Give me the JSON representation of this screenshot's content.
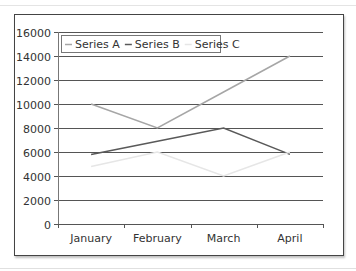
{
  "chart_data": {
    "type": "line",
    "title": "",
    "xlabel": "",
    "ylabel": "",
    "categories": [
      "January",
      "February",
      "March",
      "April"
    ],
    "series": [
      {
        "name": "Series A",
        "color": "#a6a6a6",
        "values": [
          10000,
          8000,
          11000,
          14000
        ]
      },
      {
        "name": "Series B",
        "color": "#595959",
        "values": [
          5800,
          6900,
          8000,
          5800
        ]
      },
      {
        "name": "Series C",
        "color": "#e6e6e6",
        "values": [
          4800,
          6000,
          4000,
          6000
        ]
      }
    ],
    "ylim": [
      0,
      16000
    ],
    "yticks": [
      0,
      2000,
      4000,
      6000,
      8000,
      10000,
      12000,
      14000,
      16000
    ],
    "grid": true,
    "legend_position": "top-left inside"
  },
  "legend": {
    "items": [
      "Series A",
      "Series B",
      "Series C"
    ]
  }
}
